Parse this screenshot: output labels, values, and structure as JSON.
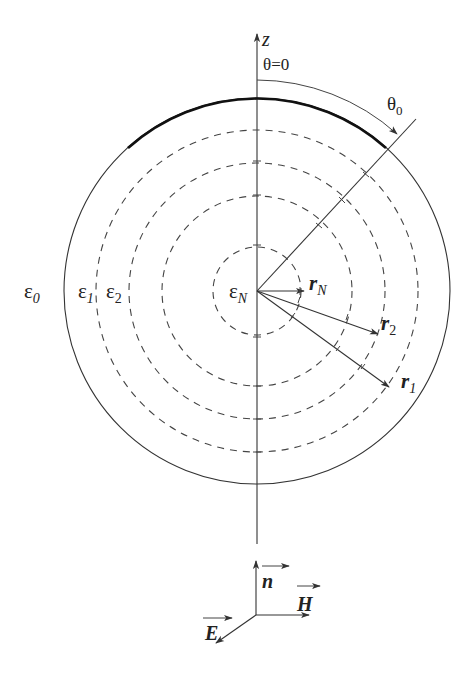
{
  "diagram": {
    "axis": {
      "label": "z",
      "theta_zero_label": "θ=0"
    },
    "angle": {
      "label": "θ",
      "subscript": "0"
    },
    "regions": [
      {
        "id": "eps0",
        "symbol": "ε",
        "subscript": "0"
      },
      {
        "id": "eps1",
        "symbol": "ε",
        "subscript": "1"
      },
      {
        "id": "eps2",
        "symbol": "ε",
        "subscript": "2"
      },
      {
        "id": "epsN",
        "symbol": "ε",
        "subscript": "N"
      }
    ],
    "radii": [
      {
        "id": "rN",
        "symbol": "r",
        "subscript": "N"
      },
      {
        "id": "r2",
        "symbol": "r",
        "subscript": "2"
      },
      {
        "id": "r1",
        "symbol": "r",
        "subscript": "1"
      }
    ],
    "triad": {
      "n": "n",
      "H": "H",
      "E": "E"
    },
    "geometry": {
      "center": [
        257,
        291
      ],
      "outer_radius": 193,
      "dashed_radii": [
        161,
        128,
        95,
        44
      ],
      "theta0_deg": 42
    },
    "colors": {
      "stroke": "#333333",
      "background": "#ffffff"
    }
  }
}
